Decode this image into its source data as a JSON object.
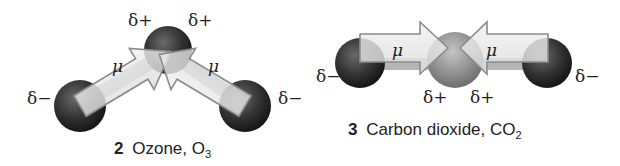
{
  "figures": [
    {
      "id": "ozone",
      "number": "2",
      "caption_name": "Ozone, O",
      "caption_subscript": "3",
      "dipole_symbol": "μ",
      "labels": {
        "center_left": "δ+",
        "center_right": "δ+",
        "outer_left": "δ−",
        "outer_right": "δ−"
      },
      "mu_labels": [
        "μ",
        "μ"
      ]
    },
    {
      "id": "carbon-dioxide",
      "number": "3",
      "caption_name": "Carbon dioxide, CO",
      "caption_subscript": "2",
      "dipole_symbol": "μ",
      "labels": {
        "center_left": "δ+",
        "center_right": "δ+",
        "outer_left": "δ−",
        "outer_right": "δ−"
      },
      "mu_labels": [
        "μ",
        "μ"
      ]
    }
  ],
  "colors": {
    "oxygen_atom": "#2a2a2a",
    "carbon_atom": "#8a8a8a",
    "arrow_fill": "#e8e8e8",
    "arrow_stroke": "#8c8c8c",
    "text": "#222222"
  }
}
